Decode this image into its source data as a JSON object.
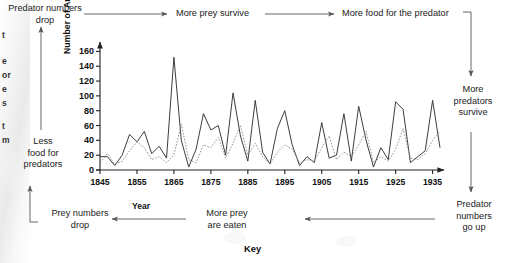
{
  "figure": {
    "key_title": "Key",
    "edge_fragments": [
      "t",
      "e",
      "or",
      "e",
      "s",
      "t",
      "m"
    ]
  },
  "flow": {
    "top_left": "Predator numbers\ndrop",
    "top_mid": "More prey survive",
    "top_right": "More food for the predator",
    "right_mid": "More\npredators\nsurvive",
    "right_bottom": "Predator\nnumbers\ngo up",
    "bottom_mid": "More prey\nare eaten",
    "bottom_left": "Prey numbers\ndrop",
    "left_mid": "Less\nfood for\npredators"
  },
  "chart_data": {
    "type": "line",
    "title": "",
    "xlabel": "Year",
    "ylabel": "Number of Animals in Thousands",
    "xlim": [
      1845,
      1937
    ],
    "ylim": [
      0,
      170
    ],
    "yticks": [
      0,
      20,
      40,
      60,
      80,
      100,
      120,
      140,
      160
    ],
    "xticks": [
      1845,
      1855,
      1865,
      1875,
      1885,
      1895,
      1905,
      1915,
      1925,
      1935
    ],
    "grid": false,
    "legend": "Key",
    "series": [
      {
        "name": "Snowshoe hare (prey)",
        "style": "solid",
        "color": "#333333",
        "x": [
          1845,
          1847,
          1849,
          1851,
          1853,
          1855,
          1857,
          1859,
          1861,
          1863,
          1865,
          1867,
          1869,
          1871,
          1873,
          1875,
          1877,
          1879,
          1881,
          1883,
          1885,
          1887,
          1889,
          1891,
          1893,
          1895,
          1897,
          1899,
          1901,
          1903,
          1905,
          1907,
          1909,
          1911,
          1913,
          1915,
          1917,
          1919,
          1921,
          1923,
          1925,
          1927,
          1929,
          1931,
          1933,
          1935,
          1937
        ],
        "values": [
          18,
          18,
          6,
          20,
          48,
          38,
          52,
          22,
          32,
          16,
          152,
          40,
          4,
          28,
          76,
          54,
          60,
          20,
          104,
          46,
          12,
          94,
          24,
          8,
          56,
          80,
          34,
          6,
          18,
          10,
          64,
          16,
          20,
          76,
          12,
          86,
          40,
          4,
          30,
          14,
          92,
          82,
          10,
          18,
          26,
          94,
          30
        ]
      },
      {
        "name": "Canada lynx (predator)",
        "style": "dotted",
        "color": "#888888",
        "x": [
          1845,
          1847,
          1849,
          1851,
          1853,
          1855,
          1857,
          1859,
          1861,
          1863,
          1865,
          1867,
          1869,
          1871,
          1873,
          1875,
          1877,
          1879,
          1881,
          1883,
          1885,
          1887,
          1889,
          1891,
          1893,
          1895,
          1897,
          1899,
          1901,
          1903,
          1905,
          1907,
          1909,
          1911,
          1913,
          1915,
          1917,
          1919,
          1921,
          1923,
          1925,
          1927,
          1929,
          1931,
          1933,
          1935,
          1937
        ],
        "values": [
          10,
          22,
          8,
          12,
          26,
          38,
          30,
          14,
          18,
          10,
          20,
          62,
          14,
          10,
          34,
          30,
          44,
          16,
          36,
          60,
          20,
          36,
          18,
          8,
          24,
          34,
          28,
          10,
          14,
          12,
          30,
          46,
          14,
          24,
          18,
          34,
          52,
          10,
          18,
          12,
          28,
          56,
          16,
          14,
          22,
          40,
          52
        ]
      }
    ]
  }
}
